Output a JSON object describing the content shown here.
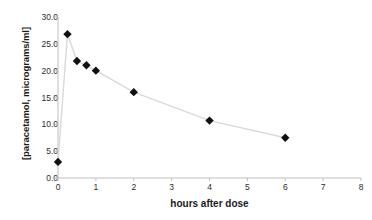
{
  "chart_data": {
    "type": "line",
    "title": "",
    "subtitle": "",
    "xlabel": "hours after dose",
    "ylabel": "[paracetamol, micrograms/ml]",
    "xlim": [
      0,
      8
    ],
    "ylim": [
      0,
      30
    ],
    "xticks": [
      "0",
      "1",
      "2",
      "3",
      "4",
      "5",
      "6",
      "7",
      "8"
    ],
    "xtick_values": [
      0,
      1,
      2,
      3,
      4,
      5,
      6,
      7,
      8
    ],
    "yticks": [
      "0.0",
      "5.0",
      "10.0",
      "15.0",
      "20.0",
      "25.0",
      "30.0"
    ],
    "ytick_values": [
      0,
      5,
      10,
      15,
      20,
      25,
      30
    ],
    "grid": false,
    "legend": "none",
    "marker": "diamond",
    "marker_color": "#111111",
    "line_color": "#d9d9d9",
    "axis_color": "#bfbfbf",
    "text_color": "#1a1a1a",
    "series": [
      {
        "name": "paracetamol concentration",
        "x": [
          0,
          0.25,
          0.5,
          0.75,
          1,
          2,
          4,
          6
        ],
        "values": [
          3.0,
          26.8,
          21.8,
          21.0,
          20.0,
          16.0,
          10.7,
          7.5
        ]
      }
    ]
  }
}
